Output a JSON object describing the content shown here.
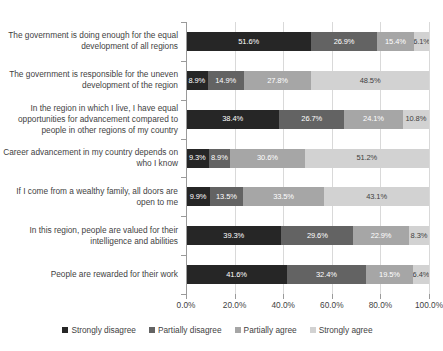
{
  "chart_data": {
    "type": "bar",
    "orientation": "horizontal",
    "stacked": true,
    "stack_mode": "percent",
    "title": "",
    "xlabel": "",
    "ylabel": "",
    "xlim": [
      0,
      100
    ],
    "xticks": [
      0,
      20,
      40,
      60,
      80,
      100
    ],
    "xtick_labels": [
      "0.0%",
      "20.0%",
      "40.0%",
      "60.0%",
      "80.0%",
      "100.0%"
    ],
    "grid": true,
    "legend_position": "bottom",
    "categories": [
      "The government is doing enough for the equal development of all regions",
      "The government is responsible for the uneven development of the region",
      "In the region in which I live, I have equal opportunities for advancement compared to people in other regions of my country",
      "Career advancement in my country depends on who I know",
      "If I come from a wealthy family, all doors are open to me",
      "In this region, people are valued for their intelligence and abilities",
      "People are rewarded for their work"
    ],
    "series": [
      {
        "name": "Strongly disagree",
        "color": "#262626",
        "values": [
          51.6,
          8.9,
          38.4,
          9.3,
          9.9,
          39.3,
          41.6
        ],
        "labels": [
          "51.6%",
          "8.9%",
          "38.4%",
          "9.3%",
          "9.9%",
          "39.3%",
          "41.6%"
        ]
      },
      {
        "name": "Partially disagree",
        "color": "#636363",
        "values": [
          26.9,
          14.9,
          26.7,
          8.9,
          13.5,
          29.6,
          32.4
        ],
        "labels": [
          "26.9%",
          "14.9%",
          "26.7%",
          "8.9%",
          "13.5%",
          "29.6%",
          "32.4%"
        ]
      },
      {
        "name": "Partially agree",
        "color": "#a6a6a6",
        "values": [
          15.4,
          27.8,
          24.1,
          30.6,
          33.5,
          22.9,
          19.5
        ],
        "labels": [
          "15.4%",
          "27.8%",
          "24.1%",
          "30.6%",
          "33.5%",
          "22.9%",
          "19.5%"
        ]
      },
      {
        "name": "Strongly agree",
        "color": "#d2d2d2",
        "values": [
          6.1,
          48.5,
          10.8,
          51.2,
          43.1,
          8.3,
          6.4
        ],
        "labels": [
          "6.1%",
          "48.5%",
          "10.8%",
          "51.2%",
          "43.1%",
          "8.3%",
          "6.4%"
        ]
      }
    ]
  }
}
